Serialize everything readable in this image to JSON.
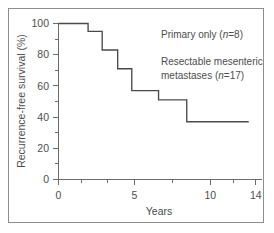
{
  "figure": {
    "border_color": "#8d8d8d",
    "background": "#ffffff"
  },
  "annotations": {
    "group1": "Primary only (n=8)",
    "group1_prefix": "Primary only (",
    "group1_italic": "n",
    "group1_suffix": "=8)",
    "group2_line1": "Resectable mesenteric",
    "group2_line2_prefix": "metastases (",
    "group2_italic": "n",
    "group2_line2_suffix": "=17)"
  },
  "axes": {
    "ylabel": "Recurrence-free survival (%)",
    "xlabel": "Years",
    "y_ticks": [
      "0",
      "20",
      "40",
      "60",
      "80",
      "100"
    ],
    "x_ticks": [
      "0",
      "5",
      "10",
      "14"
    ]
  },
  "chart_data": {
    "type": "line",
    "title": "",
    "subtitle": "",
    "xlabel": "Years",
    "ylabel": "Recurrence-free survival (%)",
    "xlim": [
      0,
      14
    ],
    "ylim": [
      0,
      100
    ],
    "grid": false,
    "legend_position": "none",
    "x_tick_labels": [
      "0",
      "5",
      "10",
      "14"
    ],
    "x_tick_values": [
      0,
      5,
      10,
      14
    ],
    "x_minor_tick_values": [
      1.5,
      2.5,
      7.5,
      12
    ],
    "y_tick_labels": [
      "0",
      "20",
      "40",
      "60",
      "80",
      "100"
    ],
    "y_tick_values": [
      0,
      20,
      40,
      60,
      80,
      100
    ],
    "y_minor_tick_values": [
      10,
      30,
      50,
      70,
      90
    ],
    "curve_style": "kaplan-meier-step",
    "series": [
      {
        "name": "Recurrence-free survival",
        "x": [
          0,
          2.1,
          2.1,
          3.1,
          3.1,
          4.2,
          4.2,
          5.2,
          5.2,
          7.1,
          7.1,
          9.1,
          9.1,
          13.5
        ],
        "y": [
          100,
          100,
          95,
          95,
          83,
          83,
          71,
          71,
          57,
          57,
          51,
          51,
          37,
          37
        ],
        "steps": [
          {
            "time": 0.0,
            "survival": 100
          },
          {
            "time": 2.1,
            "survival": 95
          },
          {
            "time": 3.1,
            "survival": 83
          },
          {
            "time": 4.2,
            "survival": 71
          },
          {
            "time": 5.2,
            "survival": 57
          },
          {
            "time": 7.1,
            "survival": 51
          },
          {
            "time": 9.1,
            "survival": 37
          },
          {
            "time": 13.5,
            "survival": 37
          }
        ]
      }
    ],
    "annotations": [
      {
        "text": "Primary only (n=8)",
        "x": 7.6,
        "y": 92
      },
      {
        "text": "Resectable mesenteric metastases (n=17)",
        "x": 7.6,
        "y": 76
      }
    ]
  }
}
